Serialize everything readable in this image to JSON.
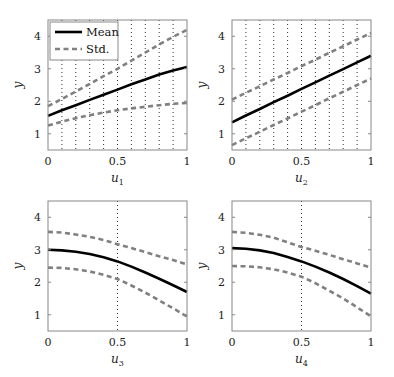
{
  "chart_data": [
    {
      "type": "line",
      "title": "",
      "xlabel": "u1",
      "ylabel": "y",
      "xlim": [
        0,
        1
      ],
      "ylim": [
        0.5,
        4.5
      ],
      "xticks": [
        "0",
        "0.5",
        "1"
      ],
      "yticks": [
        "1",
        "2",
        "3",
        "4"
      ],
      "vlines": [
        0.1,
        0.2,
        0.3,
        0.4,
        0.5,
        0.6,
        0.7,
        0.8,
        0.9
      ],
      "legend": {
        "position": "upper left",
        "entries": [
          "Mean",
          "Std."
        ]
      },
      "x": [
        0,
        0.1,
        0.2,
        0.3,
        0.4,
        0.5,
        0.6,
        0.7,
        0.8,
        0.9,
        1.0
      ],
      "series": [
        {
          "name": "Mean",
          "style": "solid",
          "values": [
            1.55,
            1.72,
            1.88,
            2.04,
            2.2,
            2.36,
            2.52,
            2.67,
            2.82,
            2.95,
            3.05
          ]
        },
        {
          "name": "Std. upper",
          "style": "dashed",
          "values": [
            1.85,
            2.07,
            2.3,
            2.53,
            2.77,
            3.0,
            3.25,
            3.5,
            3.75,
            3.98,
            4.2
          ]
        },
        {
          "name": "Std. lower",
          "style": "dashed",
          "values": [
            1.25,
            1.37,
            1.48,
            1.57,
            1.65,
            1.72,
            1.78,
            1.83,
            1.88,
            1.92,
            1.95
          ]
        }
      ]
    },
    {
      "type": "line",
      "title": "",
      "xlabel": "u2",
      "ylabel": "y",
      "xlim": [
        0,
        1
      ],
      "ylim": [
        0.5,
        4.5
      ],
      "xticks": [
        "0",
        "0.5",
        "1"
      ],
      "yticks": [
        "1",
        "2",
        "3",
        "4"
      ],
      "vlines": [
        0.1,
        0.2,
        0.3,
        0.4,
        0.5,
        0.6,
        0.7,
        0.8,
        0.9
      ],
      "x": [
        0,
        0.1,
        0.2,
        0.3,
        0.4,
        0.5,
        0.6,
        0.7,
        0.8,
        0.9,
        1.0
      ],
      "series": [
        {
          "name": "Mean",
          "style": "solid",
          "values": [
            1.35,
            1.56,
            1.76,
            1.97,
            2.17,
            2.38,
            2.58,
            2.79,
            2.99,
            3.2,
            3.4
          ]
        },
        {
          "name": "Std. upper",
          "style": "dashed",
          "values": [
            2.05,
            2.26,
            2.46,
            2.67,
            2.87,
            3.08,
            3.28,
            3.49,
            3.69,
            3.9,
            4.1
          ]
        },
        {
          "name": "Std. lower",
          "style": "dashed",
          "values": [
            0.65,
            0.86,
            1.06,
            1.27,
            1.47,
            1.68,
            1.88,
            2.09,
            2.29,
            2.5,
            2.7
          ]
        }
      ]
    },
    {
      "type": "line",
      "title": "",
      "xlabel": "u3",
      "ylabel": "y",
      "xlim": [
        0,
        1
      ],
      "ylim": [
        0.5,
        4.5
      ],
      "xticks": [
        "0",
        "0.5",
        "1"
      ],
      "yticks": [
        "1",
        "2",
        "3",
        "4"
      ],
      "vlines": [
        0.5
      ],
      "x": [
        0,
        0.1,
        0.2,
        0.3,
        0.4,
        0.5,
        0.6,
        0.7,
        0.8,
        0.9,
        1.0
      ],
      "series": [
        {
          "name": "Mean",
          "style": "solid",
          "values": [
            3.0,
            2.98,
            2.94,
            2.87,
            2.77,
            2.64,
            2.48,
            2.3,
            2.11,
            1.91,
            1.7
          ]
        },
        {
          "name": "Std. upper",
          "style": "dashed",
          "values": [
            3.55,
            3.53,
            3.47,
            3.4,
            3.3,
            3.17,
            3.05,
            2.93,
            2.8,
            2.68,
            2.55
          ]
        },
        {
          "name": "Std. lower",
          "style": "dashed",
          "values": [
            2.45,
            2.44,
            2.4,
            2.33,
            2.23,
            2.1,
            1.9,
            1.68,
            1.44,
            1.2,
            0.95
          ]
        }
      ]
    },
    {
      "type": "line",
      "title": "",
      "xlabel": "u4",
      "ylabel": "y",
      "xlim": [
        0,
        1
      ],
      "ylim": [
        0.5,
        4.5
      ],
      "xticks": [
        "0",
        "0.5",
        "1"
      ],
      "yticks": [
        "1",
        "2",
        "3",
        "4"
      ],
      "vlines": [
        0.5
      ],
      "x": [
        0,
        0.1,
        0.2,
        0.3,
        0.4,
        0.5,
        0.6,
        0.7,
        0.8,
        0.9,
        1.0
      ],
      "series": [
        {
          "name": "Mean",
          "style": "solid",
          "values": [
            3.05,
            3.03,
            2.98,
            2.9,
            2.78,
            2.64,
            2.48,
            2.3,
            2.1,
            1.88,
            1.65
          ]
        },
        {
          "name": "Std. upper",
          "style": "dashed",
          "values": [
            3.55,
            3.52,
            3.46,
            3.37,
            3.23,
            3.08,
            2.97,
            2.84,
            2.71,
            2.58,
            2.45
          ]
        },
        {
          "name": "Std. lower",
          "style": "dashed",
          "values": [
            2.5,
            2.49,
            2.46,
            2.4,
            2.3,
            2.17,
            1.97,
            1.74,
            1.5,
            1.23,
            0.95
          ]
        }
      ]
    }
  ],
  "legend": {
    "mean_label": "Mean",
    "std_label": "Std."
  },
  "colors": {
    "mean": "#000000",
    "std": "#808080",
    "grid": "#333333",
    "frame": "#888888"
  }
}
